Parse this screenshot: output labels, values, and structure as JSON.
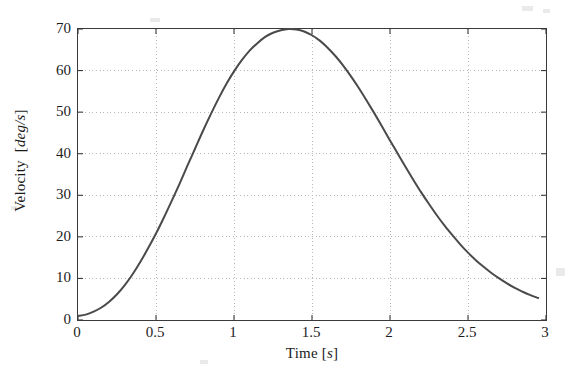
{
  "chart_data": {
    "type": "line",
    "title": "",
    "subtitle": "",
    "xlabel": "Time [s]",
    "xlabel_name": "Time",
    "xlabel_unit": "s",
    "ylabel": "Velocity [deg/s]",
    "ylabel_name": "Velocity",
    "ylabel_unit": "deg/s",
    "xlim": [
      0,
      3
    ],
    "ylim": [
      0,
      70
    ],
    "xticks": [
      0,
      0.5,
      1,
      1.5,
      2,
      2.5,
      3
    ],
    "xticklabels": [
      "0",
      "0.5",
      "1",
      "1.5",
      "2",
      "2.5",
      "3"
    ],
    "yticks": [
      0,
      10,
      20,
      30,
      40,
      50,
      60,
      70
    ],
    "yticklabels": [
      "0",
      "10",
      "20",
      "30",
      "40",
      "50",
      "60",
      "70"
    ],
    "grid": "dotted",
    "grid_color": "#b9b9b9",
    "legend": "none",
    "series": [
      {
        "name": "velocity",
        "color": "#4a4a4a",
        "linewidth": 2.0,
        "x": [
          0.0,
          0.05,
          0.1,
          0.15,
          0.2,
          0.25,
          0.3,
          0.35,
          0.4,
          0.45,
          0.5,
          0.55,
          0.6,
          0.65,
          0.7,
          0.75,
          0.8,
          0.85,
          0.9,
          0.95,
          1.0,
          1.05,
          1.1,
          1.15,
          1.2,
          1.25,
          1.3,
          1.35,
          1.4,
          1.45,
          1.5,
          1.55,
          1.6,
          1.65,
          1.7,
          1.75,
          1.8,
          1.85,
          1.9,
          1.95,
          2.0,
          2.05,
          2.1,
          2.15,
          2.2,
          2.25,
          2.3,
          2.35,
          2.4,
          2.45,
          2.5,
          2.55,
          2.6,
          2.65,
          2.7,
          2.75,
          2.8,
          2.85,
          2.9,
          2.95
        ],
        "y": [
          1.0,
          1.3,
          2.0,
          3.0,
          4.4,
          6.2,
          8.4,
          11.0,
          14.0,
          17.3,
          20.8,
          24.6,
          28.6,
          32.7,
          37.0,
          41.2,
          45.4,
          49.4,
          53.2,
          56.7,
          59.8,
          62.5,
          64.8,
          66.6,
          68.1,
          69.1,
          69.7,
          70.0,
          69.9,
          69.4,
          68.5,
          67.2,
          65.5,
          63.5,
          61.2,
          58.6,
          55.8,
          52.8,
          49.7,
          46.5,
          43.2,
          40.0,
          36.8,
          33.7,
          30.7,
          27.9,
          25.2,
          22.7,
          20.4,
          18.2,
          16.2,
          14.4,
          12.8,
          11.3,
          10.0,
          8.8,
          7.7,
          6.8,
          6.0,
          5.3
        ],
        "peak_x": 1.35,
        "peak_y": 70.0,
        "start_y": 1.0,
        "end_y": 5.3
      }
    ],
    "annotations": []
  },
  "figure": {
    "background_color": "#ffffff",
    "axis_color": "#3a3a3a",
    "text_color": "#1d1d1d"
  }
}
